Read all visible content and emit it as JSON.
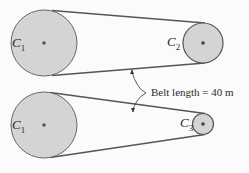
{
  "diagram": {
    "colors": {
      "pulley_fill": "#d4d4d4",
      "stroke": "#555555",
      "hub": "#555555",
      "background": "#fbfbfb"
    },
    "top": {
      "pulley_large": {
        "label": "C",
        "sub": "1"
      },
      "pulley_small": {
        "label": "C",
        "sub": "2"
      }
    },
    "bottom": {
      "pulley_large": {
        "label": "C",
        "sub": "1"
      },
      "pulley_small": {
        "label": "C",
        "sub": "3"
      }
    },
    "annotation": "Belt length = 40 m"
  }
}
